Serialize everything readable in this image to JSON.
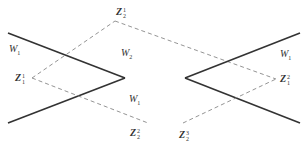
{
  "diagram": {
    "type": "geometric-lattice-diagram",
    "colors": {
      "solid_line": "#333333",
      "dashed_line": "#888888",
      "label": "#333333"
    },
    "left_panel": {
      "labels": [
        {
          "id": "W1_top",
          "base": "W",
          "sub": "1",
          "sup": ""
        },
        {
          "id": "W2",
          "base": "W",
          "sub": "2",
          "sup": ""
        },
        {
          "id": "W1_bottom",
          "base": "W",
          "sub": "1",
          "sup": ""
        },
        {
          "id": "Z1_1",
          "base": "Z",
          "sub": "1",
          "sup": "1"
        },
        {
          "id": "Z2_1",
          "base": "Z",
          "sub": "2",
          "sup": "1"
        },
        {
          "id": "Z2_2",
          "base": "Z",
          "sub": "2",
          "sup": "2"
        }
      ]
    },
    "right_panel": {
      "labels": [
        {
          "id": "W1_right",
          "base": "W",
          "sub": "1",
          "sup": ""
        },
        {
          "id": "Z1_2",
          "base": "Z",
          "sub": "1",
          "sup": "2"
        },
        {
          "id": "Z2_3",
          "base": "Z",
          "sub": "2",
          "sup": "3"
        }
      ]
    }
  }
}
